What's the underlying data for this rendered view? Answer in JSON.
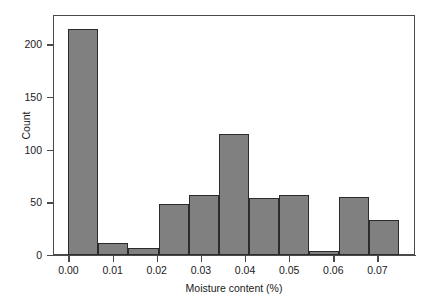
{
  "chart_data": {
    "type": "bar",
    "chart_subtype": "histogram",
    "title": "",
    "xlabel": "Moisture content (%)",
    "ylabel": "Count",
    "grid": false,
    "legend": null,
    "xlim": [
      -0.0035,
      0.0785
    ],
    "ylim": [
      0,
      228
    ],
    "bin_width": 0.0068,
    "x_ticks": [
      0.0,
      0.01,
      0.02,
      0.03,
      0.04,
      0.05,
      0.06,
      0.07
    ],
    "x_tick_labels": [
      "0.00",
      "0.01",
      "0.02",
      "0.03",
      "0.04",
      "0.05",
      "0.06",
      "0.07"
    ],
    "y_ticks": [
      0,
      50,
      100,
      150,
      200
    ],
    "y_tick_labels": [
      "0",
      "50",
      "100",
      "150",
      "200"
    ],
    "bin_edges": [
      0.0,
      0.0068,
      0.0136,
      0.0204,
      0.0272,
      0.034,
      0.0408,
      0.0476,
      0.0544,
      0.0612,
      0.068,
      0.0748
    ],
    "categories": [
      "0.0000-0.0068",
      "0.0068-0.0136",
      "0.0136-0.0204",
      "0.0204-0.0272",
      "0.0272-0.0340",
      "0.0340-0.0408",
      "0.0408-0.0476",
      "0.0476-0.0544",
      "0.0544-0.0612",
      "0.0612-0.0680",
      "0.0680-0.0748"
    ],
    "values": [
      215,
      11,
      7,
      48,
      57,
      115,
      54,
      57,
      4,
      55,
      33
    ],
    "bar_fill_color": "#808080",
    "bar_edge_color": "#2b2b2b",
    "frame_color": "#4a4a4a",
    "background_color": "#ffffff"
  }
}
